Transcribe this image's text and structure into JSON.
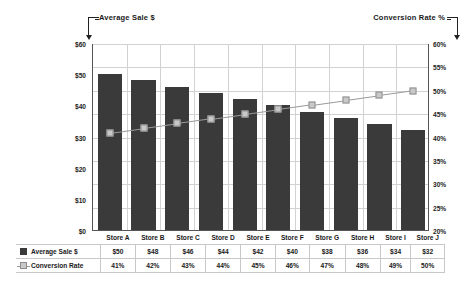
{
  "annotations": {
    "left_axis_label": "Average Sale $",
    "right_axis_label": "Conversion Rate %"
  },
  "chart_data": {
    "type": "bar",
    "title": "",
    "xlabel": "",
    "ylabel": "Average Sale $",
    "y2label": "Conversion Rate %",
    "categories": [
      "Store A",
      "Store B",
      "Store C",
      "Store D",
      "Store E",
      "Store F",
      "Store G",
      "Store H",
      "Store I",
      "Store J"
    ],
    "series": [
      {
        "name": "Average Sale $",
        "type": "bar",
        "axis": "left",
        "color": "#3a3a3a",
        "values": [
          50,
          48,
          46,
          44,
          42,
          40,
          38,
          36,
          34,
          32
        ],
        "labels": [
          "$50",
          "$48",
          "$46",
          "$44",
          "$42",
          "$40",
          "$38",
          "$36",
          "$34",
          "$32"
        ]
      },
      {
        "name": "Conversion Rate",
        "type": "line",
        "axis": "right",
        "color": "#c9c9c9",
        "line_color": "#9a9a9a",
        "values": [
          41,
          42,
          43,
          44,
          45,
          46,
          47,
          48,
          49,
          50
        ],
        "labels": [
          "41%",
          "42%",
          "43%",
          "44%",
          "45%",
          "46%",
          "47%",
          "48%",
          "49%",
          "50%"
        ]
      }
    ],
    "ylim": [
      0,
      60
    ],
    "yticks": [
      0,
      10,
      20,
      30,
      40,
      50,
      60
    ],
    "ytick_labels": [
      "$0",
      "$10",
      "$20",
      "$30",
      "$40",
      "$50",
      "$60"
    ],
    "y2lim": [
      20,
      60
    ],
    "y2ticks": [
      20,
      25,
      30,
      35,
      40,
      45,
      50,
      55,
      60
    ],
    "y2tick_labels": [
      "20%",
      "25%",
      "30%",
      "35%",
      "40%",
      "45%",
      "50%",
      "55%",
      "60%"
    ],
    "grid": true,
    "legend": "table"
  },
  "table": {
    "row_labels": [
      "Average Sale $",
      "Conversion Rate"
    ]
  }
}
